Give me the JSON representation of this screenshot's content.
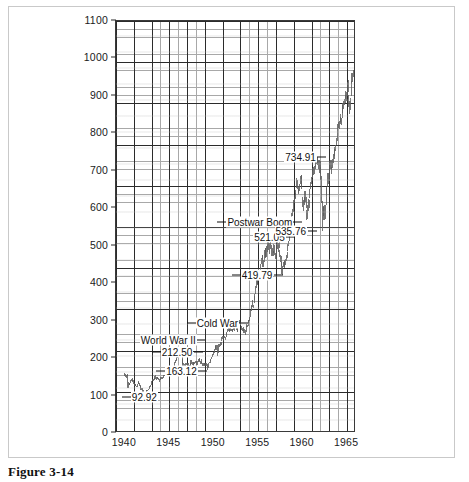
{
  "figure": {
    "caption": "Figure 3-14"
  },
  "chart_data": {
    "type": "bar",
    "subtype": "high-low price bars (monthly range)",
    "title": "",
    "xlabel": "",
    "ylabel": "",
    "xlim": [
      1939.0,
      1966.0
    ],
    "ylim": [
      0,
      1100
    ],
    "grid": true,
    "grid_minor": true,
    "legend": false,
    "x_ticks": [
      "1940",
      "1945",
      "1950",
      "1955",
      "1960",
      "1965"
    ],
    "x_tick_values": [
      1940,
      1945,
      1950,
      1955,
      1960,
      1965
    ],
    "y_ticks": [
      "0",
      "100",
      "200",
      "300",
      "400",
      "500",
      "600",
      "700",
      "800",
      "900",
      "1000",
      "1100"
    ],
    "y_tick_values": [
      0,
      100,
      200,
      300,
      400,
      500,
      600,
      700,
      800,
      900,
      1000,
      1100
    ],
    "annotations": [
      {
        "label": "92.92",
        "x": 1942.3,
        "y": 92.92,
        "leader": "left"
      },
      {
        "label": "163.12",
        "x": 1946.5,
        "y": 163.12,
        "leader": "both"
      },
      {
        "label": "212.50",
        "x": 1946.0,
        "y": 212.5,
        "leader": "both"
      },
      {
        "label": "World War II",
        "x": 1945.0,
        "y": 245.0,
        "leader": "right"
      },
      {
        "label": "Cold War",
        "x": 1950.5,
        "y": 290.0,
        "leader": "both"
      },
      {
        "label": "419.79",
        "x": 1955.0,
        "y": 419.79,
        "leader": "both"
      },
      {
        "label": "521.05",
        "x": 1956.4,
        "y": 521.05,
        "leader": "right"
      },
      {
        "label": "Postwar Boom",
        "x": 1955.3,
        "y": 560.0,
        "leader": "both"
      },
      {
        "label": "535.76",
        "x": 1958.8,
        "y": 535.76,
        "leader": "right"
      },
      {
        "label": "734.91",
        "x": 1959.9,
        "y": 734.91,
        "leader": "right"
      }
    ],
    "x": [
      1940.0,
      1940.083,
      1940.167,
      1940.25,
      1940.333,
      1940.417,
      1940.5,
      1940.583,
      1940.667,
      1940.75,
      1940.833,
      1940.917,
      1941.0,
      1941.083,
      1941.167,
      1941.25,
      1941.333,
      1941.417,
      1941.5,
      1941.583,
      1941.667,
      1941.75,
      1941.833,
      1941.917,
      1942.0,
      1942.083,
      1942.167,
      1942.25,
      1942.333,
      1942.417,
      1942.5,
      1942.583,
      1942.667,
      1942.75,
      1942.833,
      1942.917,
      1943.0,
      1943.083,
      1943.167,
      1943.25,
      1943.333,
      1943.417,
      1943.5,
      1943.583,
      1943.667,
      1943.75,
      1943.833,
      1943.917,
      1944.0,
      1944.083,
      1944.167,
      1944.25,
      1944.333,
      1944.417,
      1944.5,
      1944.583,
      1944.667,
      1944.75,
      1944.833,
      1944.917,
      1945.0,
      1945.083,
      1945.167,
      1945.25,
      1945.333,
      1945.417,
      1945.5,
      1945.583,
      1945.667,
      1945.75,
      1945.833,
      1945.917,
      1946.0,
      1946.083,
      1946.167,
      1946.25,
      1946.333,
      1946.417,
      1946.5,
      1946.583,
      1946.667,
      1946.75,
      1946.833,
      1946.917,
      1947.0,
      1947.083,
      1947.167,
      1947.25,
      1947.333,
      1947.417,
      1947.5,
      1947.583,
      1947.667,
      1947.75,
      1947.833,
      1947.917,
      1948.0,
      1948.083,
      1948.167,
      1948.25,
      1948.333,
      1948.417,
      1948.5,
      1948.583,
      1948.667,
      1948.75,
      1948.833,
      1948.917,
      1949.0,
      1949.083,
      1949.167,
      1949.25,
      1949.333,
      1949.417,
      1949.5,
      1949.583,
      1949.667,
      1949.75,
      1949.833,
      1949.917,
      1950.0,
      1950.083,
      1950.167,
      1950.25,
      1950.333,
      1950.417,
      1950.5,
      1950.583,
      1950.667,
      1950.75,
      1950.833,
      1950.917,
      1951.0,
      1951.083,
      1951.167,
      1951.25,
      1951.333,
      1951.417,
      1951.5,
      1951.583,
      1951.667,
      1951.75,
      1951.833,
      1951.917,
      1952.0,
      1952.083,
      1952.167,
      1952.25,
      1952.333,
      1952.417,
      1952.5,
      1952.583,
      1952.667,
      1952.75,
      1952.833,
      1952.917,
      1953.0,
      1953.083,
      1953.167,
      1953.25,
      1953.333,
      1953.417,
      1953.5,
      1953.583,
      1953.667,
      1953.75,
      1953.833,
      1953.917,
      1954.0,
      1954.083,
      1954.167,
      1954.25,
      1954.333,
      1954.417,
      1954.5,
      1954.583,
      1954.667,
      1954.75,
      1954.833,
      1954.917,
      1955.0,
      1955.083,
      1955.167,
      1955.25,
      1955.333,
      1955.417,
      1955.5,
      1955.583,
      1955.667,
      1955.75,
      1955.833,
      1955.917,
      1956.0,
      1956.083,
      1956.167,
      1956.25,
      1956.333,
      1956.417,
      1956.5,
      1956.583,
      1956.667,
      1956.75,
      1956.833,
      1956.917,
      1957.0,
      1957.083,
      1957.167,
      1957.25,
      1957.333,
      1957.417,
      1957.5,
      1957.583,
      1957.667,
      1957.75,
      1957.833,
      1957.917,
      1958.0,
      1958.083,
      1958.167,
      1958.25,
      1958.333,
      1958.417,
      1958.5,
      1958.583,
      1958.667,
      1958.75,
      1958.833,
      1958.917,
      1959.0,
      1959.083,
      1959.167,
      1959.25,
      1959.333,
      1959.417,
      1959.5,
      1959.583,
      1959.667,
      1959.75,
      1959.833,
      1959.917,
      1960.0,
      1960.083,
      1960.167,
      1960.25,
      1960.333,
      1960.417,
      1960.5,
      1960.583,
      1960.667,
      1960.75,
      1960.833,
      1960.917,
      1961.0,
      1961.083,
      1961.167,
      1961.25,
      1961.333,
      1961.417,
      1961.5,
      1961.583,
      1961.667,
      1961.75,
      1961.833,
      1961.917,
      1962.0,
      1962.083,
      1962.167,
      1962.25,
      1962.333,
      1962.417,
      1962.5,
      1962.583,
      1962.667,
      1962.75,
      1962.833,
      1962.917,
      1963.0,
      1963.083,
      1963.167,
      1963.25,
      1963.333,
      1963.417,
      1963.5,
      1963.583,
      1963.667,
      1963.75,
      1963.833,
      1963.917,
      1964.0,
      1964.083,
      1964.167,
      1964.25,
      1964.333,
      1964.417,
      1964.5,
      1964.583,
      1964.667,
      1964.75,
      1964.833,
      1964.917,
      1965.0,
      1965.083,
      1965.167,
      1965.25,
      1965.333,
      1965.417,
      1965.5,
      1965.583,
      1965.667,
      1965.75,
      1965.833,
      1965.917
    ],
    "high": [
      152,
      149,
      148,
      150,
      148,
      127,
      126,
      125,
      134,
      136,
      138,
      134,
      133,
      125,
      124,
      123,
      118,
      122,
      130,
      128,
      126,
      120,
      116,
      112,
      113,
      107,
      101,
      99,
      102,
      106,
      107,
      107,
      110,
      114,
      117,
      120,
      126,
      131,
      136,
      137,
      140,
      143,
      146,
      142,
      142,
      141,
      139,
      136,
      137,
      141,
      142,
      141,
      142,
      148,
      148,
      149,
      148,
      147,
      147,
      152,
      156,
      160,
      162,
      166,
      169,
      170,
      166,
      175,
      181,
      186,
      190,
      195,
      207,
      208,
      212,
      210,
      208,
      205,
      203,
      190,
      178,
      176,
      174,
      178,
      180,
      180,
      180,
      178,
      175,
      178,
      186,
      186,
      181,
      182,
      182,
      182,
      184,
      184,
      180,
      184,
      190,
      192,
      190,
      184,
      182,
      190,
      178,
      178,
      180,
      178,
      178,
      178,
      176,
      170,
      178,
      183,
      186,
      190,
      196,
      202,
      204,
      208,
      218,
      225,
      229,
      228,
      228,
      222,
      231,
      230,
      235,
      236,
      248,
      252,
      251,
      250,
      253,
      250,
      260,
      263,
      272,
      273,
      273,
      272,
      274,
      272,
      270,
      272,
      274,
      276,
      281,
      280,
      282,
      275,
      275,
      293,
      294,
      289,
      290,
      280,
      274,
      270,
      276,
      272,
      267,
      278,
      284,
      281,
      294,
      296,
      304,
      322,
      333,
      335,
      348,
      336,
      360,
      364,
      386,
      404,
      409,
      412,
      419,
      426,
      430,
      445,
      463,
      469,
      470,
      456,
      484,
      488,
      490,
      494,
      516,
      521,
      503,
      502,
      521,
      506,
      496,
      489,
      482,
      499,
      496,
      476,
      475,
      499,
      504,
      503,
      520,
      484,
      469,
      466,
      450,
      440,
      450,
      455,
      456,
      459,
      470,
      478,
      500,
      509,
      520,
      544,
      558,
      584,
      594,
      603,
      617,
      625,
      636,
      645,
      678,
      671,
      656,
      648,
      660,
      682,
      685,
      686,
      627,
      618,
      625,
      641,
      641,
      627,
      590,
      605,
      620,
      618,
      648,
      667,
      680,
      696,
      705,
      706,
      710,
      722,
      731,
      735,
      734,
      732,
      726,
      725,
      724,
      707,
      684,
      615,
      601,
      600,
      604,
      605,
      650,
      654,
      690,
      690,
      696,
      722,
      726,
      725,
      708,
      729,
      741,
      756,
      760,
      767,
      785,
      801,
      822,
      827,
      831,
      842,
      850,
      838,
      875,
      880,
      885,
      891,
      902,
      912,
      908,
      935,
      941,
      901,
      885,
      893,
      939,
      960,
      961,
      969
    ],
    "low": [
      144,
      142,
      140,
      144,
      112,
      111,
      119,
      120,
      126,
      130,
      130,
      128,
      124,
      117,
      117,
      116,
      114,
      114,
      122,
      122,
      118,
      112,
      107,
      106,
      101,
      100,
      95,
      93,
      96,
      100,
      104,
      104,
      106,
      108,
      112,
      114,
      119,
      125,
      130,
      132,
      134,
      137,
      137,
      134,
      136,
      136,
      133,
      129,
      134,
      135,
      137,
      136,
      138,
      141,
      144,
      145,
      144,
      143,
      143,
      147,
      151,
      154,
      156,
      160,
      162,
      163,
      159,
      165,
      173,
      179,
      184,
      188,
      194,
      198,
      199,
      200,
      199,
      196,
      177,
      170,
      164,
      163,
      164,
      168,
      173,
      171,
      172,
      166,
      161,
      169,
      175,
      177,
      175,
      172,
      175,
      176,
      178,
      178,
      167,
      174,
      182,
      185,
      181,
      176,
      176,
      178,
      171,
      171,
      174,
      172,
      172,
      172,
      168,
      161,
      167,
      178,
      180,
      185,
      189,
      195,
      197,
      200,
      206,
      214,
      218,
      214,
      197,
      206,
      222,
      222,
      225,
      228,
      239,
      244,
      246,
      245,
      246,
      242,
      249,
      255,
      264,
      265,
      265,
      263,
      265,
      265,
      263,
      265,
      267,
      266,
      271,
      273,
      269,
      262,
      262,
      274,
      286,
      281,
      281,
      268,
      265,
      259,
      266,
      261,
      255,
      264,
      276,
      275,
      279,
      286,
      291,
      303,
      320,
      323,
      331,
      327,
      340,
      349,
      365,
      382,
      388,
      392,
      399,
      408,
      417,
      424,
      445,
      455,
      438,
      438,
      450,
      464,
      462,
      465,
      478,
      496,
      484,
      473,
      496,
      485,
      468,
      468,
      466,
      475,
      469,
      459,
      457,
      471,
      487,
      477,
      489,
      465,
      450,
      440,
      419,
      417,
      437,
      436,
      438,
      443,
      453,
      463,
      480,
      495,
      508,
      522,
      533,
      557,
      574,
      587,
      601,
      611,
      620,
      624,
      650,
      647,
      636,
      633,
      641,
      660,
      657,
      648,
      599,
      589,
      604,
      612,
      614,
      596,
      565,
      568,
      588,
      596,
      623,
      647,
      662,
      678,
      687,
      686,
      689,
      702,
      708,
      714,
      712,
      717,
      702,
      691,
      688,
      673,
      611,
      535,
      564,
      574,
      565,
      568,
      604,
      629,
      652,
      662,
      669,
      694,
      701,
      702,
      688,
      703,
      718,
      729,
      737,
      750,
      766,
      778,
      800,
      812,
      809,
      824,
      827,
      820,
      840,
      852,
      864,
      874,
      880,
      889,
      885,
      899,
      910,
      869,
      849,
      861,
      898,
      930,
      935,
      949
    ]
  }
}
